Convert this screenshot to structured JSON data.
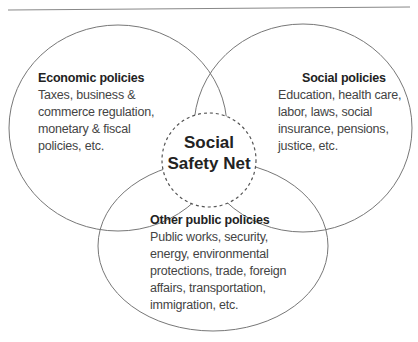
{
  "diagram": {
    "type": "venn",
    "center": {
      "line1": "Social",
      "line2": "Safety Net"
    },
    "sets": [
      {
        "title": "Economic policies",
        "lines": [
          "Taxes, business &",
          "commerce regulation,",
          "monetary & fiscal",
          "policies, etc."
        ]
      },
      {
        "title": "Social policies",
        "lines": [
          "Education, health care,",
          "labor, laws, social",
          "insurance, pensions,",
          "justice, etc."
        ]
      },
      {
        "title": "Other public policies",
        "lines": [
          "Public works, security,",
          "energy, environmental",
          "protections, trade, foreign",
          "affairs, transportation,",
          "immigration, etc."
        ]
      }
    ],
    "colors": {
      "stroke": "#777777",
      "text": "#444444"
    }
  }
}
